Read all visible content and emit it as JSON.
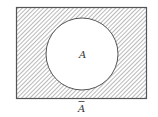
{
  "diagram": {
    "type": "venn",
    "universe": {
      "shaded": true,
      "hatch": "diagonal"
    },
    "set": {
      "label": "A",
      "shaded": false
    },
    "complement_label": "A",
    "complement_overline": true,
    "colors": {
      "stroke": "#555555",
      "hatch": "#8a8a8a",
      "background": "#ffffff"
    }
  }
}
